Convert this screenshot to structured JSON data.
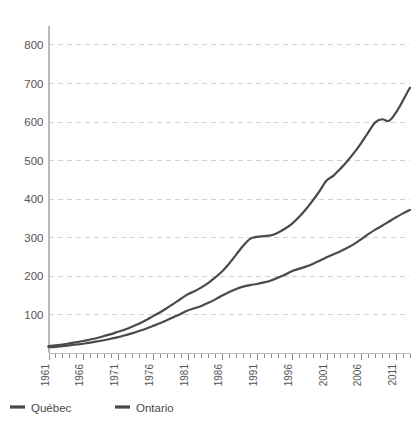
{
  "chart_data": {
    "type": "line",
    "title": "",
    "subtitle": "",
    "xlabel": "",
    "ylabel": "",
    "xlim": [
      1961,
      2013
    ],
    "ylim": [
      0,
      840
    ],
    "grid": true,
    "legend_position": "bottom-left",
    "y_ticks": [
      100,
      200,
      300,
      400,
      500,
      600,
      700,
      800
    ],
    "x_ticks": [
      1961,
      1966,
      1971,
      1976,
      1981,
      1986,
      1991,
      1996,
      2001,
      2006,
      2011
    ],
    "x_tick_labels": [
      "1961",
      "1966",
      "1971",
      "1976",
      "1981",
      "1986",
      "1991",
      "1996",
      "2001",
      "2006",
      "2011"
    ],
    "y_tick_labels": [
      "100",
      "200",
      "300",
      "400",
      "500",
      "600",
      "700",
      "800"
    ],
    "x": [
      1961,
      1962,
      1963,
      1964,
      1965,
      1966,
      1967,
      1968,
      1969,
      1970,
      1971,
      1972,
      1973,
      1974,
      1975,
      1976,
      1977,
      1978,
      1979,
      1980,
      1981,
      1982,
      1983,
      1984,
      1985,
      1986,
      1987,
      1988,
      1989,
      1990,
      1991,
      1992,
      1993,
      1994,
      1995,
      1996,
      1997,
      1998,
      1999,
      2000,
      2001,
      2002,
      2003,
      2004,
      2005,
      2006,
      2007,
      2008,
      2009,
      2010,
      2011,
      2012,
      2013
    ],
    "series": [
      {
        "name": "Québec",
        "color": "#4a4a4a",
        "values": [
          18,
          20,
          22,
          25,
          28,
          31,
          35,
          39,
          44,
          49,
          55,
          61,
          68,
          76,
          85,
          95,
          105,
          116,
          128,
          140,
          152,
          160,
          170,
          182,
          196,
          212,
          232,
          255,
          278,
          296,
          301,
          303,
          305,
          312,
          322,
          335,
          352,
          372,
          395,
          420,
          447,
          460,
          478,
          498,
          520,
          545,
          572,
          598,
          606,
          602,
          624,
          655,
          688
        ]
      },
      {
        "name": "Ontario",
        "color": "#4a4a4a",
        "values": [
          15,
          16,
          18,
          20,
          22,
          24,
          27,
          30,
          33,
          37,
          41,
          46,
          51,
          57,
          63,
          70,
          77,
          85,
          93,
          101,
          110,
          116,
          122,
          130,
          139,
          149,
          158,
          166,
          172,
          176,
          179,
          183,
          188,
          195,
          203,
          212,
          218,
          224,
          231,
          239,
          248,
          256,
          264,
          273,
          283,
          295,
          308,
          320,
          330,
          341,
          352,
          362,
          371
        ]
      }
    ]
  },
  "legend": {
    "items": [
      {
        "label": "Québec"
      },
      {
        "label": "Ontario"
      }
    ]
  }
}
